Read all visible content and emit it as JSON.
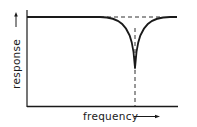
{
  "diagram": {
    "type": "notch-filter-response",
    "x_axis_label": "frequency",
    "y_axis_label": "response",
    "curve": {
      "description": "flat response with a sharp notch (dip) at center frequency",
      "baseline_level": "max",
      "notch_center_marked": true
    },
    "reference_line": "dashed horizontal line at passband level",
    "center_marker": "dashed vertical line at notch frequency",
    "colors": {
      "ink": "#1a1a1a",
      "background": "#ffffff"
    }
  }
}
